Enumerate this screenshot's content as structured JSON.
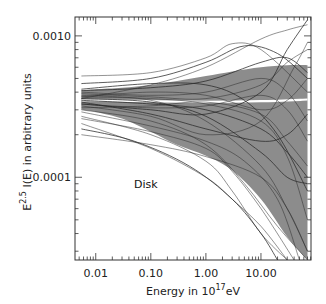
{
  "chart_data": {
    "type": "line",
    "title": "",
    "annotation": "Disk",
    "xlabel": "Energy in 10^17 eV",
    "xlabel_parts": {
      "base": "Energy in 10",
      "sup": "17",
      "tail": "eV"
    },
    "ylabel": "E^2.5 I(E) in arbitrary units",
    "ylabel_parts": {
      "base": "E",
      "sup": "2.5",
      "tail": " I(E) in arbitrary units"
    },
    "xscale": "log",
    "yscale": "log",
    "xlim": [
      0.0042,
      81
    ],
    "ylim": [
      2.6e-05,
      0.00136
    ],
    "x_ticks": [
      0.01,
      0.1,
      1,
      10
    ],
    "x_tick_labels": [
      "0.01",
      "0.10",
      "1.00",
      "10.00"
    ],
    "y_ticks": [
      0.0001,
      0.001
    ],
    "y_tick_labels": [
      "0.0001",
      "0.0010"
    ],
    "grid": false,
    "legend": null,
    "colors": {
      "band": "#8c8c8c",
      "mean_line": "#ffffff",
      "curves": "#2a2a2a",
      "frame": "#333333"
    },
    "band": {
      "name": "spread (shaded region)",
      "x": [
        0.0055,
        0.01,
        0.03,
        0.1,
        0.3,
        1,
        3,
        10,
        30,
        70
      ],
      "upper": [
        0.00041,
        0.00042,
        0.00043,
        0.00045,
        0.00048,
        0.00052,
        0.00056,
        0.0006,
        0.00062,
        0.00062
      ],
      "lower": [
        0.0003,
        0.00029,
        0.00026,
        0.00021,
        0.00017,
        0.000142,
        0.000112,
        7e-05,
        3.8e-05,
        2.6e-05
      ]
    },
    "mean": {
      "name": "mean",
      "x": [
        0.0055,
        0.01,
        0.1,
        1,
        10,
        70
      ],
      "y": [
        0.00035,
        0.00035,
        0.000345,
        0.000342,
        0.000345,
        0.000355
      ]
    },
    "series": [
      {
        "name": "curve 1",
        "x": [
          0.0055,
          0.1,
          1,
          5,
          20,
          70
        ],
        "y": [
          0.00046,
          0.0005,
          0.00065,
          0.00085,
          0.00075,
          0.0005
        ]
      },
      {
        "name": "curve 2",
        "x": [
          0.0055,
          0.1,
          1,
          3,
          10,
          70
        ],
        "y": [
          0.00052,
          0.00055,
          0.0007,
          0.00088,
          0.0008,
          0.0004
        ]
      },
      {
        "name": "curve 3",
        "x": [
          0.0055,
          0.1,
          1,
          10,
          30,
          70
        ],
        "y": [
          0.00036,
          0.00045,
          0.0006,
          0.00095,
          0.0011,
          0.0012
        ]
      },
      {
        "name": "curve 4",
        "x": [
          0.0055,
          0.1,
          1,
          10,
          30,
          70
        ],
        "y": [
          0.00033,
          0.0003,
          0.00028,
          0.0004,
          0.0008,
          0.0013
        ]
      },
      {
        "name": "curve 5",
        "x": [
          0.0055,
          0.1,
          1,
          10,
          30,
          70
        ],
        "y": [
          0.00038,
          0.00035,
          0.00025,
          0.00012,
          6e-05,
          3e-05
        ]
      },
      {
        "name": "curve 6",
        "x": [
          0.0055,
          0.1,
          1,
          5,
          20,
          70
        ],
        "y": [
          0.0003,
          0.00025,
          0.00017,
          9e-05,
          4.5e-05,
          2.6e-05
        ]
      },
      {
        "name": "curve 7",
        "x": [
          0.0055,
          0.1,
          1,
          5,
          20,
          70
        ],
        "y": [
          0.00042,
          0.00046,
          0.00045,
          0.00035,
          0.0002,
          8e-05
        ]
      },
      {
        "name": "curve 8",
        "x": [
          0.0055,
          0.1,
          1,
          10,
          40,
          70
        ],
        "y": [
          0.00032,
          0.00027,
          0.0002,
          0.00025,
          0.0006,
          0.0009
        ]
      },
      {
        "name": "curve 9",
        "x": [
          0.0055,
          0.1,
          1,
          3,
          10,
          30
        ],
        "y": [
          0.00027,
          0.0002,
          0.00013,
          8e-05,
          4e-05,
          2.6e-05
        ]
      },
      {
        "name": "curve 10",
        "x": [
          0.0055,
          0.1,
          1,
          10,
          30,
          70
        ],
        "y": [
          0.00035,
          0.00033,
          0.0003,
          0.00022,
          0.00015,
          0.0001
        ]
      },
      {
        "name": "curve 11",
        "x": [
          0.0055,
          0.1,
          1,
          10,
          30,
          70
        ],
        "y": [
          0.0004,
          0.00038,
          0.0004,
          0.0005,
          0.0004,
          0.00025
        ]
      },
      {
        "name": "curve 12",
        "x": [
          0.0055,
          0.1,
          1,
          3,
          10,
          30
        ],
        "y": [
          0.00024,
          0.00016,
          0.0001,
          7e-05,
          4.5e-05,
          2.6e-05
        ]
      },
      {
        "name": "curve 13",
        "x": [
          0.0055,
          0.05,
          0.5,
          3,
          10,
          20
        ],
        "y": [
          0.00022,
          0.00018,
          0.00012,
          7e-05,
          4e-05,
          2.6e-05
        ]
      },
      {
        "name": "curve 14",
        "x": [
          0.0055,
          0.1,
          1,
          10,
          30,
          70
        ],
        "y": [
          0.00031,
          0.00032,
          0.00034,
          0.00028,
          0.00018,
          0.00012
        ]
      },
      {
        "name": "curve 15",
        "x": [
          0.0055,
          0.1,
          1,
          10,
          30,
          70
        ],
        "y": [
          0.00037,
          0.0004,
          0.00038,
          0.0003,
          0.00035,
          0.0005
        ]
      },
      {
        "name": "curve 16",
        "x": [
          0.0055,
          0.1,
          1,
          10,
          30,
          70
        ],
        "y": [
          0.00034,
          0.00028,
          0.00022,
          0.00018,
          0.0002,
          0.00028
        ]
      },
      {
        "name": "curve 17",
        "x": [
          0.0055,
          0.1,
          1,
          5,
          20,
          50
        ],
        "y": [
          0.00029,
          0.00023,
          0.00018,
          0.00013,
          7e-05,
          2.6e-05
        ]
      },
      {
        "name": "curve 18",
        "x": [
          0.0055,
          0.1,
          1,
          10,
          30,
          70
        ],
        "y": [
          0.00039,
          0.00037,
          0.00036,
          0.00045,
          0.00065,
          0.0008
        ]
      },
      {
        "name": "curve 19",
        "x": [
          0.0055,
          0.1,
          1,
          10,
          30,
          70
        ],
        "y": [
          0.00036,
          0.00034,
          0.00027,
          0.00015,
          0.0001,
          9e-05
        ]
      },
      {
        "name": "curve 20",
        "x": [
          0.0055,
          0.1,
          1,
          10,
          30,
          70
        ],
        "y": [
          0.00033,
          0.00031,
          0.00032,
          0.00038,
          0.0003,
          0.00018
        ]
      },
      {
        "name": "curve 21",
        "x": [
          0.0055,
          0.1,
          1,
          10,
          30,
          70
        ],
        "y": [
          0.0002,
          0.00017,
          0.00014,
          0.0001,
          6e-05,
          3e-05
        ]
      },
      {
        "name": "curve 22",
        "x": [
          0.0055,
          0.1,
          1,
          10,
          30,
          70
        ],
        "y": [
          0.00041,
          0.00043,
          0.00048,
          0.00065,
          0.0007,
          0.00055
        ]
      },
      {
        "name": "curve 23",
        "x": [
          0.0055,
          0.1,
          1,
          3,
          10,
          40
        ],
        "y": [
          0.00026,
          0.00021,
          0.00016,
          0.00011,
          6e-05,
          2.6e-05
        ]
      },
      {
        "name": "curve 24",
        "x": [
          0.0055,
          0.1,
          1,
          10,
          30,
          70
        ],
        "y": [
          0.00037,
          0.00036,
          0.00033,
          0.00025,
          0.00014,
          5e-05
        ]
      }
    ]
  }
}
